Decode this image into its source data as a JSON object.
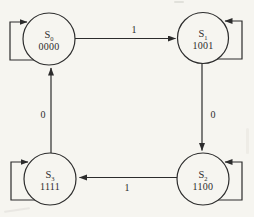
{
  "page": {
    "background": "#f6f5f0",
    "ink": "#2c2c2c"
  },
  "diagram": {
    "type": "state-machine",
    "states": [
      {
        "id": "s0",
        "name": "S",
        "sub": "0",
        "code": "0000",
        "cx": 49,
        "cy": 39,
        "r": 26,
        "loop": "left"
      },
      {
        "id": "s1",
        "name": "S",
        "sub": "1",
        "code": "1001",
        "cx": 203,
        "cy": 38,
        "r": 25.5,
        "loop": "right"
      },
      {
        "id": "s3",
        "name": "S",
        "sub": "3",
        "code": "1111",
        "cx": 50,
        "cy": 179,
        "r": 26,
        "loop": "left"
      },
      {
        "id": "s2",
        "name": "S",
        "sub": "2",
        "code": "1100",
        "cx": 203,
        "cy": 179,
        "r": 26,
        "loop": "right"
      }
    ],
    "transitions": [
      {
        "from": "s0",
        "to": "s1",
        "label": "1",
        "x1": 75,
        "y1": 38.5,
        "x2": 175.5,
        "y2": 38.5,
        "lx": 134,
        "ly": 33
      },
      {
        "from": "s1",
        "to": "s2",
        "label": "0",
        "x1": 202,
        "y1": 63,
        "x2": 202,
        "y2": 150.5,
        "lx": 213,
        "ly": 118
      },
      {
        "from": "s2",
        "to": "s3",
        "label": "1",
        "x1": 177,
        "y1": 177.5,
        "x2": 79.5,
        "y2": 177.5,
        "lx": 127,
        "ly": 191
      },
      {
        "from": "s3",
        "to": "s0",
        "label": "0",
        "x1": 51,
        "y1": 153,
        "x2": 51,
        "y2": 68,
        "lx": 43,
        "ly": 118
      }
    ],
    "loop_geometry": {
      "outer_dx": 39,
      "top_dy": -17,
      "bottom_dy": 21,
      "tip_dx": 22,
      "start_dx": 12
    }
  }
}
